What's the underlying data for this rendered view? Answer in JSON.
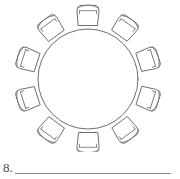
{
  "worksheet": {
    "question_number": "8.",
    "answer_line_value": "",
    "answer_line_placeholder": ""
  },
  "diagram": {
    "line_color": "#6e6e6e",
    "fill_color": "#ffffff",
    "background_color": "#ffffff",
    "table": {
      "shape": "circle",
      "center_x": 88,
      "center_y": 79,
      "radius": 50
    },
    "chairs": {
      "count": 10,
      "angles_deg": [
        270,
        306,
        342,
        18,
        54,
        90,
        126,
        162,
        198,
        234
      ],
      "seat_width": 22,
      "seat_depth": 17,
      "distance_from_center": 62
    }
  }
}
